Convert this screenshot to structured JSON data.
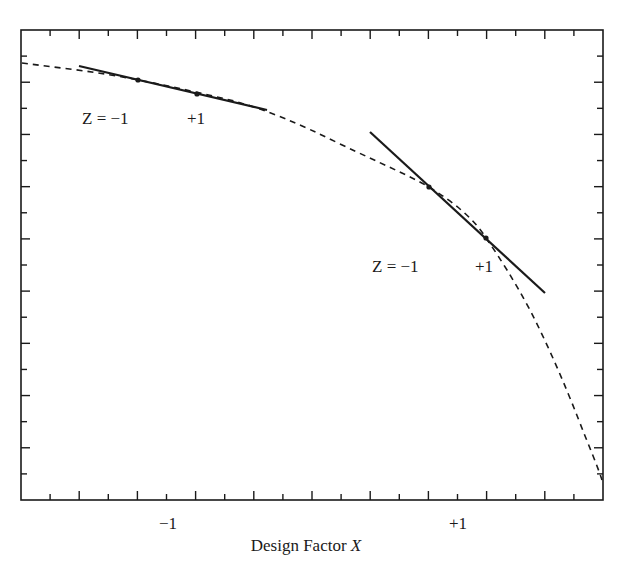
{
  "chart_data": {
    "type": "line",
    "title": "",
    "xlabel": "Design Factor X",
    "ylabel": "",
    "x_tick_labels": [
      {
        "label": "−1",
        "x": -1
      },
      {
        "label": "+1",
        "x": 1
      }
    ],
    "xlim": [
      -1.8,
      2.2
    ],
    "ylim": [
      0,
      1
    ],
    "grid": false,
    "legend": null,
    "series": [
      {
        "name": "response curve",
        "style": "dashed",
        "points": [
          [
            -1.8,
            0.92
          ],
          [
            -1.4,
            0.9
          ],
          [
            -1.0,
            0.89
          ],
          [
            -0.6,
            0.86
          ],
          [
            -0.2,
            0.82
          ],
          [
            0.2,
            0.77
          ],
          [
            0.6,
            0.71
          ],
          [
            1.0,
            0.64
          ],
          [
            1.2,
            0.6
          ],
          [
            1.4,
            0.53
          ],
          [
            1.6,
            0.43
          ],
          [
            1.8,
            0.31
          ],
          [
            2.0,
            0.19
          ],
          [
            2.2,
            0.05
          ]
        ]
      },
      {
        "name": "tangent at X=-1",
        "style": "solid",
        "points": [
          [
            -1.4,
            0.91
          ],
          [
            -0.1,
            0.82
          ]
        ],
        "markers": [
          {
            "z": -1,
            "x": -1.0,
            "y": 0.89
          },
          {
            "z": 1,
            "x": -0.6,
            "y": 0.86
          }
        ]
      },
      {
        "name": "tangent at X=+1",
        "style": "solid",
        "points": [
          [
            0.6,
            0.78
          ],
          [
            1.8,
            0.44
          ]
        ],
        "markers": [
          {
            "z": -1,
            "x": 1.0,
            "y": 0.66
          },
          {
            "z": 1,
            "x": 1.4,
            "y": 0.55
          }
        ]
      }
    ],
    "annotations": [
      {
        "text": "Z = −1",
        "near": "left tangent, point Z=-1"
      },
      {
        "text": "+1",
        "near": "left tangent, point Z=+1"
      },
      {
        "text": "Z = −1",
        "near": "right tangent, point Z=-1"
      },
      {
        "text": "+1",
        "near": "right tangent, point Z=+1"
      }
    ],
    "x_tick_count": 20,
    "y_tick_count": 18
  },
  "labels": {
    "left_z_minus": "Z = −1",
    "left_z_plus": "+1",
    "right_z_minus": "Z = −1",
    "right_z_plus": "+1",
    "x_tick_minus": "−1",
    "x_tick_plus": "+1",
    "x_axis_title_main": "Design Factor ",
    "x_axis_title_var": "X"
  },
  "colors": {
    "ink": "#1a1a1a",
    "background": "#ffffff"
  }
}
